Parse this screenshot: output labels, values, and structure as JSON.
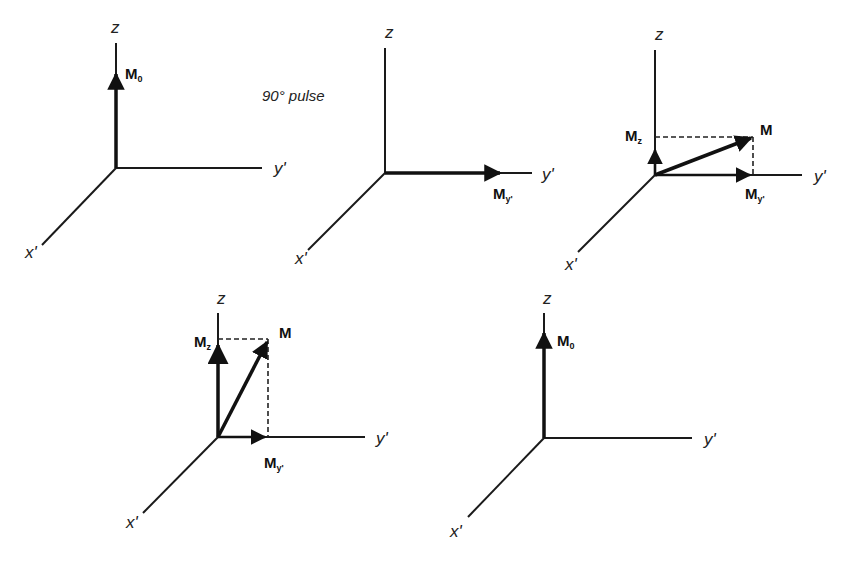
{
  "diagram": {
    "pulse_label": "90° pulse",
    "axis_labels": {
      "z": "z",
      "y": "y'",
      "x": "x'"
    },
    "vector_labels": {
      "M0": "M",
      "M0_sub": "0",
      "M": "M",
      "Mz": "M",
      "Mz_sub": "z",
      "My": "M",
      "My_sub": "y'"
    },
    "panels": [
      {
        "id": 1,
        "origin": [
          116,
          168
        ],
        "vectors": [
          "M0 along z"
        ]
      },
      {
        "id": 2,
        "origin": [
          385,
          173
        ],
        "vectors": [
          "My' along y'"
        ]
      },
      {
        "id": 3,
        "origin": [
          655,
          175
        ],
        "vectors": [
          "M",
          "Mz",
          "My'"
        ]
      },
      {
        "id": 4,
        "origin": [
          218,
          437
        ],
        "vectors": [
          "M",
          "Mz",
          "My'"
        ]
      },
      {
        "id": 5,
        "origin": [
          544,
          438
        ],
        "vectors": [
          "M0 along z"
        ]
      }
    ]
  }
}
